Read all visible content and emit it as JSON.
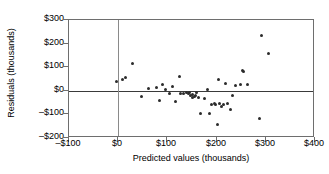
{
  "chart_data": {
    "type": "scatter",
    "title": "",
    "xlabel": "Predicted values (thousands)",
    "ylabel": "Residuals (thousands)",
    "xlim": [
      -100,
      400
    ],
    "ylim": [
      -200,
      300
    ],
    "xticks": [
      -100,
      0,
      100,
      200,
      300,
      400
    ],
    "yticks": [
      -200,
      -100,
      0,
      100,
      200,
      300
    ],
    "xtick_labels": [
      "–$100",
      "$0",
      "$100",
      "$200",
      "$300",
      "$400"
    ],
    "ytick_labels": [
      "–$200",
      "–$100",
      "$0",
      "$100",
      "$200",
      "$300"
    ],
    "grid": false,
    "legend": null,
    "reference_lines": [
      {
        "orientation": "horizontal",
        "value": 0,
        "color": "#3a3a3a"
      },
      {
        "orientation": "vertical",
        "value": 0,
        "color": "#8a8a8a"
      }
    ],
    "marker": {
      "shape": "circle",
      "color": "#2b2b2b",
      "size": 3
    },
    "points": [
      {
        "x": -4,
        "y": 38
      },
      {
        "x": 8,
        "y": 46
      },
      {
        "x": 14,
        "y": 57
      },
      {
        "x": 30,
        "y": 114
      },
      {
        "x": 47,
        "y": -23
      },
      {
        "x": 62,
        "y": 8
      },
      {
        "x": 78,
        "y": 12
      },
      {
        "x": 84,
        "y": -42
      },
      {
        "x": 90,
        "y": 28
      },
      {
        "x": 96,
        "y": 4
      },
      {
        "x": 104,
        "y": -10
      },
      {
        "x": 110,
        "y": 18
      },
      {
        "x": 116,
        "y": -46
      },
      {
        "x": 124,
        "y": 62
      },
      {
        "x": 127,
        "y": -12
      },
      {
        "x": 133,
        "y": -10
      },
      {
        "x": 138,
        "y": -6
      },
      {
        "x": 142,
        "y": -12
      },
      {
        "x": 145,
        "y": -8
      },
      {
        "x": 147,
        "y": -18
      },
      {
        "x": 150,
        "y": -14
      },
      {
        "x": 152,
        "y": -30
      },
      {
        "x": 155,
        "y": -26
      },
      {
        "x": 158,
        "y": -22
      },
      {
        "x": 160,
        "y": -8
      },
      {
        "x": 163,
        "y": -30
      },
      {
        "x": 168,
        "y": -97
      },
      {
        "x": 176,
        "y": -34
      },
      {
        "x": 182,
        "y": 6
      },
      {
        "x": 186,
        "y": -96
      },
      {
        "x": 190,
        "y": -56
      },
      {
        "x": 195,
        "y": -52
      },
      {
        "x": 198,
        "y": -58
      },
      {
        "x": 201,
        "y": -142
      },
      {
        "x": 204,
        "y": 46
      },
      {
        "x": 206,
        "y": -54
      },
      {
        "x": 210,
        "y": -68
      },
      {
        "x": 214,
        "y": -56
      },
      {
        "x": 218,
        "y": 30
      },
      {
        "x": 222,
        "y": -52
      },
      {
        "x": 228,
        "y": -80
      },
      {
        "x": 232,
        "y": -18
      },
      {
        "x": 238,
        "y": 24
      },
      {
        "x": 248,
        "y": 26
      },
      {
        "x": 252,
        "y": 88
      },
      {
        "x": 254,
        "y": 80
      },
      {
        "x": 262,
        "y": 26
      },
      {
        "x": 288,
        "y": -116
      },
      {
        "x": 292,
        "y": 236
      },
      {
        "x": 306,
        "y": 156
      }
    ]
  }
}
